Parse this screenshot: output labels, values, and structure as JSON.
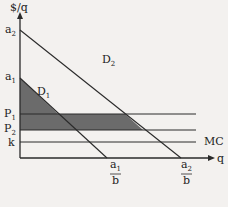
{
  "diagram": {
    "y_axis_label": "$/q",
    "x_axis_label": "q",
    "intercepts": {
      "a2": {
        "main": "a",
        "sub": "2"
      },
      "a1": {
        "main": "a",
        "sub": "1"
      }
    },
    "price_levels": {
      "P1": {
        "main": "P",
        "sub": "1"
      },
      "P2": {
        "main": "P",
        "sub": "2"
      },
      "k": {
        "main": "k"
      }
    },
    "curves": {
      "D2": {
        "main": "D",
        "sub": "2"
      },
      "D1": {
        "main": "D",
        "sub": "1"
      },
      "MC": "MC"
    },
    "x_intercepts": {
      "a1_over_b": {
        "num_main": "a",
        "num_sub": "1",
        "den": "b"
      },
      "a2_over_b": {
        "num_main": "a",
        "num_sub": "2",
        "den": "b"
      }
    },
    "colors": {
      "background": "#f3f1ef",
      "shaded": "#6b6b6b",
      "line": "#2a2a2a"
    }
  }
}
